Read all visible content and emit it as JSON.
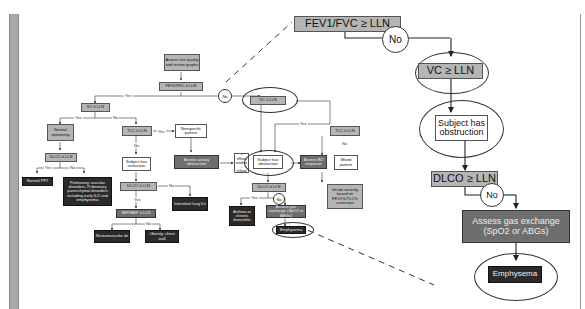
{
  "diagram": {
    "type": "flowchart",
    "main": {
      "assess": "Assess test quality and review graphs",
      "fev1fvc": "FEV1/FVC ≥ LLN",
      "yes": "Yes",
      "no": "No",
      "vc_left": "VC ≥ LLN",
      "normal_spiro": "Normal spirometry",
      "dlco_left": "DLCO ≥ LLN",
      "normal_pft": "Normal PFT",
      "pulm_vascular": "Pulmonary vascular disorders, Pulmonary parenchymal disorders including early ILD and emphysema",
      "tlc_left": "TLC ≥ LLN",
      "nonspecific": "Nonspecific pattern",
      "assess_airway": "Assess airway obstruction",
      "raw": "↑ sRaw and/or ↓ sGaw",
      "restriction": "Subject has restriction",
      "dlco_restr": "DLCO ≥ LLN",
      "interstitial": "Interstitial lung Dz",
      "mip_mep": "MIP/MEP ≥ LLN",
      "neuromuscular": "Neuromuscular dz",
      "obesity": "Obesity, chest wall",
      "vc_right": "VC ≥ LLN",
      "obstruction": "Subject has obstruction",
      "assess_bd": "Assess BD response",
      "tlc_right": "TLC ≥ LLN",
      "mixed": "Mixed pattern",
      "grade": "Grade severity based on FEV1%/TLC% correction",
      "dlco_obs": "DLCO ≥ LLN",
      "asthma": "Asthma or chronic bronchitis",
      "gas_small": "Assess gas exchange (SpO2 or ABGs)",
      "emphysema_small": "Emphysema"
    },
    "zoom_panel": {
      "fev1fvc": "FEV1/FVC ≥ LLN",
      "no1": "No",
      "vc": "VC ≥ LLN",
      "obstruction": "Subject has obstruction",
      "dlco": "DLCO ≥ LLN",
      "no2": "No",
      "gas": "Assess gas exchange",
      "gas2": "(SpO2 or ABGs)",
      "emphysema": "Emphysema"
    }
  }
}
